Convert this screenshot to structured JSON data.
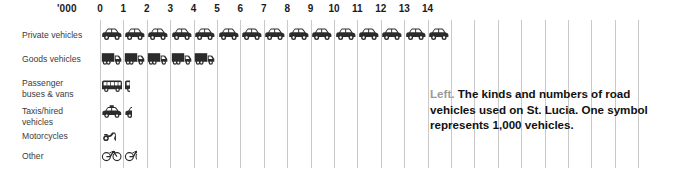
{
  "axis": {
    "unit_label": "'000",
    "ticks": [
      "0",
      "1",
      "2",
      "3",
      "4",
      "5",
      "6",
      "7",
      "8",
      "9",
      "10",
      "11",
      "12",
      "13",
      "14"
    ]
  },
  "caption": {
    "lead": "Left.",
    "text": "The kinds and numbers of road vehicles used on St. Lucia. One symbol represents 1,000 vehicles."
  },
  "colors": {
    "symbol": "#2b2b2b",
    "gridline": "#c9c9c9",
    "axis_text": "#1a1a1a",
    "row_label": "#3b3b3b",
    "caption_lead": "#9a9a9a",
    "caption_text": "#111111",
    "background": "#ffffff"
  },
  "chart_data": {
    "type": "bar",
    "title": "",
    "subtitle": "",
    "xlabel": "'000",
    "ylabel": "",
    "xlim": [
      0,
      15
    ],
    "grid": true,
    "legend": "none",
    "unit": "1,000 vehicles per symbol",
    "pictogram": true,
    "categories": [
      "Private vehicles",
      "Goods vehicles",
      "Passenger buses & vans",
      "Taxis/hired vehicles",
      "Motorcycles",
      "Other"
    ],
    "values": [
      15,
      5,
      1.3,
      1.35,
      0.7,
      1.6
    ],
    "symbols": [
      "car",
      "truck",
      "bus",
      "taxi",
      "motorcycle",
      "bicycle"
    ],
    "annotations": [
      "Left. The kinds and numbers of road vehicles used on St. Lucia. One symbol represents 1,000 vehicles."
    ]
  },
  "rows": [
    {
      "label_line1": "Private vehicles",
      "label_line2": "",
      "symbol": "car-icon",
      "value": 15
    },
    {
      "label_line1": "Goods vehicles",
      "label_line2": "",
      "symbol": "truck-icon",
      "value": 5
    },
    {
      "label_line1": "Passenger",
      "label_line2": "buses & vans",
      "symbol": "bus-icon",
      "value": 1.3
    },
    {
      "label_line1": "Taxis/hired",
      "label_line2": "vehicles",
      "symbol": "taxi-icon",
      "value": 1.35
    },
    {
      "label_line1": "Motorcycles",
      "label_line2": "",
      "symbol": "motorcycle-icon",
      "value": 0.7
    },
    {
      "label_line1": "Other",
      "label_line2": "",
      "symbol": "bicycle-icon",
      "value": 1.6
    }
  ]
}
